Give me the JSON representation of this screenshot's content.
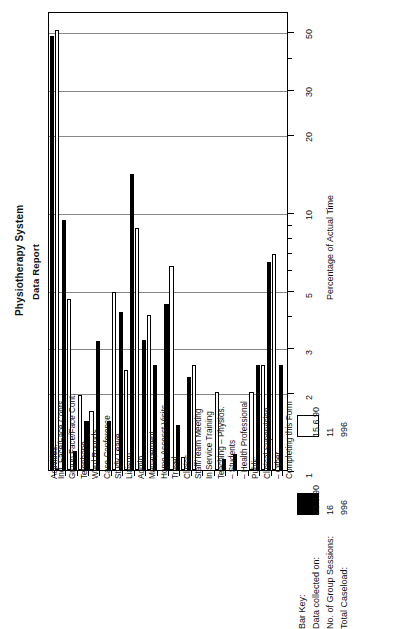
{
  "titles": {
    "main": "Physiotherapy System",
    "sub": "Data Report"
  },
  "axes": {
    "value_axis_title": "Percentage of Actual Time",
    "category_axis_title": "Activities:"
  },
  "legend": {
    "heading": "Bar Key:",
    "rows": [
      {
        "label": "Data collected on:"
      },
      {
        "label": "No. of Group Sessions:"
      },
      {
        "label": "Total Caseload:"
      }
    ],
    "series": [
      {
        "swatch": "black",
        "date": "22.3.90",
        "sessions": "16",
        "caseload": "996"
      },
      {
        "swatch": "white",
        "date": "15.6.90",
        "sessions": "11",
        "caseload": "996"
      }
    ]
  },
  "chart_data": {
    "type": "bar",
    "title": "Physiotherapy System Data Report",
    "xlabel": "Activities:",
    "ylabel": "Percentage of Actual Time",
    "yscale": "log",
    "ylim": [
      1,
      60
    ],
    "grid": true,
    "legend_position": "bottom-right",
    "ticks_major": [
      1,
      2,
      3,
      5,
      10,
      20,
      30,
      50
    ],
    "ticks_labeled": [
      "1",
      "2",
      "3",
      "5",
      "10",
      "20",
      "30",
      "50"
    ],
    "ticks_minor": [
      4,
      6,
      7,
      8,
      9,
      40
    ],
    "categories": [
      "Ind. Face/Face Conts",
      "Group Face/Face Cont.",
      "Telephone",
      "Ward Rounds",
      "Case Conference",
      "Study Leave",
      "Liaison",
      "Admin.",
      "Management",
      "Home Assesst Visits",
      "Travel",
      "Clinics",
      "Staff/Team Meeting",
      "In Service Training",
      "Teaching  –  Physios.",
      "–  Students",
      "–  Health Professional",
      "Public",
      "Clinical Supervision",
      "–  Other",
      "Completing this Form"
    ],
    "series": [
      {
        "name": "22.3.90",
        "color": "#000000",
        "values": [
          48.0,
          9.3,
          1.18,
          1.55,
          3.15,
          1.55,
          4.1,
          14.0,
          3.2,
          2.55,
          4.4,
          1.5,
          2.3,
          0,
          0,
          1.1,
          1.15,
          0,
          2.55,
          6.4,
          2.55
        ]
      },
      {
        "name": "15.6.90",
        "color": "#ffffff",
        "values": [
          50.5,
          4.6,
          1.95,
          1.7,
          0,
          4.9,
          2.45,
          8.7,
          4.0,
          0,
          6.2,
          1.12,
          2.55,
          0,
          2.0,
          0,
          0,
          2.0,
          2.55,
          6.9,
          0
        ]
      }
    ]
  }
}
